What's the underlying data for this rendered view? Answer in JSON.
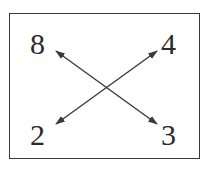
{
  "diagram": {
    "labels": {
      "top_left": "8",
      "top_right": "4",
      "bottom_left": "2",
      "bottom_right": "3"
    },
    "arrows": [
      {
        "from": "bottom_left",
        "to": "top_right",
        "double_headed": true
      },
      {
        "from": "top_left",
        "to": "bottom_right",
        "double_headed": true
      }
    ],
    "colors": {
      "line": "#3a3a3a",
      "text": "#2a2a2a",
      "border": "#3a3a3a"
    }
  }
}
